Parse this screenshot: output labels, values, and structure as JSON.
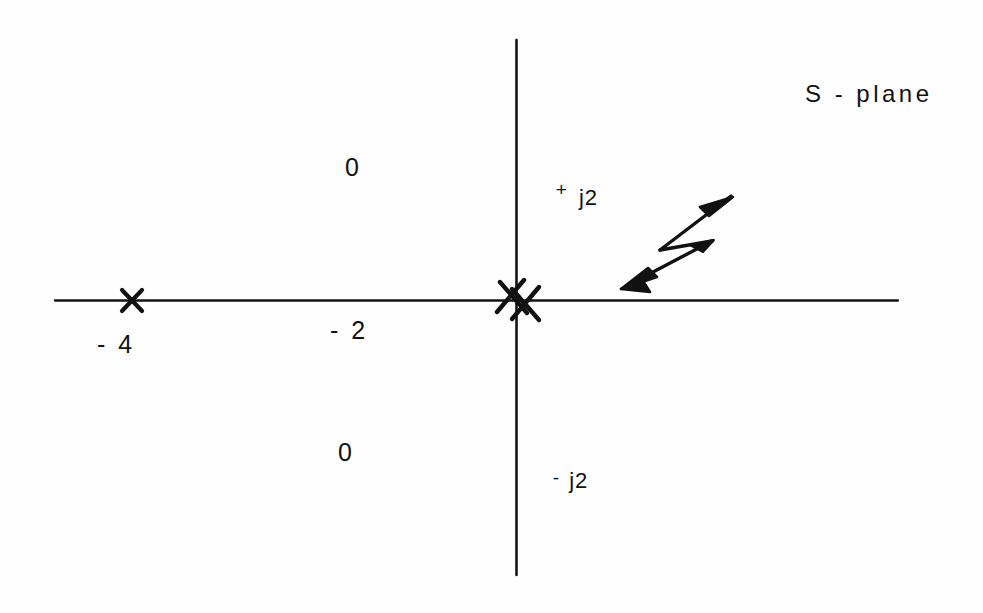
{
  "figure": {
    "title": "S - plane",
    "kind": "pole-zero-plot",
    "ink_color": "#111111",
    "background_color": "#ffffff"
  },
  "axes": {
    "real_axis_name": "real-axis",
    "imag_axis_name": "imaginary-axis",
    "origin_px": {
      "x": 516,
      "y": 300
    },
    "real_axis_extent_px": {
      "x1": 55,
      "x2": 898
    },
    "imag_axis_extent_px": {
      "y1": 40,
      "y2": 575
    }
  },
  "labels": {
    "quadrant_upper_left_zero": "0",
    "quadrant_lower_left_zero": "0",
    "real_tick_minus_four": "- 4",
    "real_tick_minus_two": "- 2",
    "imag_tick_plus_j2_sign": "+",
    "imag_tick_plus_j2_value": "j2",
    "imag_tick_minus_j2_sign": "-",
    "imag_tick_minus_j2_value": "j2",
    "plane_label": "S - plane"
  },
  "markers": [
    {
      "name": "pole-at-minus-four",
      "symbol": "x",
      "meaning": "pole",
      "value_label": "- 4",
      "px": {
        "x": 132,
        "y": 300
      }
    },
    {
      "name": "double-pole-at-origin",
      "symbol": "xx",
      "meaning": "double pole",
      "value_label": "0",
      "px": {
        "x": 516,
        "y": 300
      }
    }
  ],
  "annotations": [
    {
      "name": "double-headed-arrow",
      "meaning": "root locus direction indicator",
      "from_px": {
        "x": 730,
        "y": 197
      },
      "to_px": {
        "x": 622,
        "y": 286
      }
    }
  ],
  "chart_data": {
    "type": "scatter",
    "title": "S - plane",
    "xlabel": "real axis",
    "ylabel": "imaginary axis",
    "grid": false,
    "legend": null,
    "xlim": [
      -4.8,
      4.2
    ],
    "ylim": [
      -3.2,
      2.9
    ],
    "xticks": [
      -4,
      -2
    ],
    "xticklabels": [
      "- 4",
      "- 2"
    ],
    "yticks": [
      2,
      -2
    ],
    "yticklabels": [
      "+ j2",
      "- j2"
    ],
    "series": [
      {
        "name": "poles",
        "marker": "x",
        "points": [
          {
            "x": -4,
            "y": 0,
            "multiplicity": 1
          },
          {
            "x": 0,
            "y": 0,
            "multiplicity": 2
          }
        ]
      }
    ],
    "annotations": [
      {
        "text": "0",
        "x": -1.85,
        "y": 1.46,
        "note": "quadrant marker upper left"
      },
      {
        "text": "0",
        "x": -1.95,
        "y": -1.75,
        "note": "quadrant marker lower left"
      },
      {
        "text": "S - plane",
        "x": 3.1,
        "y": 2.35
      },
      {
        "text": "double-headed arrow",
        "x": 1.6,
        "y": 0.55,
        "note": "direction of movement"
      }
    ]
  }
}
